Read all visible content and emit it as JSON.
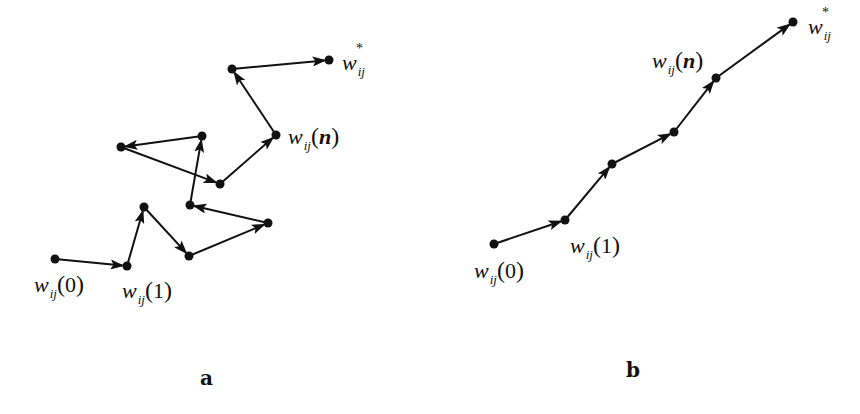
{
  "panels": [
    {
      "id": "a",
      "caption": "a",
      "description": "Erratic (random-walk) weight trajectory",
      "nodes": [
        {
          "x": 55,
          "y": 259
        },
        {
          "x": 127,
          "y": 266
        },
        {
          "x": 144,
          "y": 207
        },
        {
          "x": 189,
          "y": 256
        },
        {
          "x": 268,
          "y": 223
        },
        {
          "x": 190,
          "y": 205
        },
        {
          "x": 202,
          "y": 136
        },
        {
          "x": 121,
          "y": 147
        },
        {
          "x": 220,
          "y": 184
        },
        {
          "x": 276,
          "y": 135
        },
        {
          "x": 232,
          "y": 69
        },
        {
          "x": 329,
          "y": 60
        }
      ],
      "labels": {
        "start": {
          "symbol": "w",
          "subscript": "ij",
          "arg": "0"
        },
        "first": {
          "symbol": "w",
          "subscript": "ij",
          "arg": "1"
        },
        "nth": {
          "symbol": "w",
          "subscript": "ij",
          "arg": "n"
        },
        "optimum": {
          "symbol": "w",
          "subscript": "ij",
          "superscript": "*"
        }
      }
    },
    {
      "id": "b",
      "caption": "b",
      "description": "Smooth, direct weight trajectory",
      "nodes": [
        {
          "x": 494,
          "y": 244
        },
        {
          "x": 565,
          "y": 220
        },
        {
          "x": 612,
          "y": 164
        },
        {
          "x": 674,
          "y": 132
        },
        {
          "x": 716,
          "y": 78
        },
        {
          "x": 793,
          "y": 22
        }
      ],
      "labels": {
        "start": {
          "symbol": "w",
          "subscript": "ij",
          "arg": "0"
        },
        "first": {
          "symbol": "w",
          "subscript": "ij",
          "arg": "1"
        },
        "nth": {
          "symbol": "w",
          "subscript": "ij",
          "arg": "n"
        },
        "optimum": {
          "symbol": "w",
          "subscript": "ij",
          "superscript": "*"
        }
      }
    }
  ],
  "style": {
    "stroke_color": "#111111",
    "node_color": "#111111",
    "background": "#ffffff"
  }
}
